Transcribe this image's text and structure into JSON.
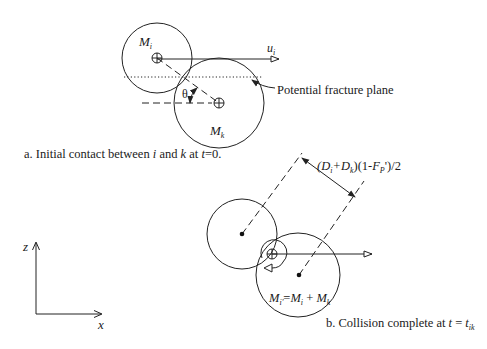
{
  "panel_a": {
    "caption_prefix": "a. Initial contact between ",
    "caption_i": "i",
    "caption_and": " and ",
    "caption_k": "k",
    "caption_at": " at ",
    "caption_t": "t",
    "caption_eq": "=0.",
    "mass_i": {
      "M": "M",
      "sub": "i"
    },
    "mass_k": {
      "M": "M",
      "sub": "k"
    },
    "velocity": {
      "u": "u",
      "sub": "i"
    },
    "angle_label": "θ",
    "fracture_label": "Potential fracture plane"
  },
  "panel_b": {
    "caption_prefix": "b. Collision complete at ",
    "caption_t": "t",
    "caption_eq": " = ",
    "caption_t2": "t",
    "caption_sub": "ik",
    "distance_label": {
      "open": "(",
      "D1": "D",
      "D1_sub": "i",
      "plus": "+",
      "D2": "D",
      "D2_sub": "k",
      "mid": ")(1-",
      "F": "F",
      "F_sub": "P",
      "end": "')/2"
    },
    "merged_mass": {
      "M1": "M",
      "M1_sub": "i'",
      "eq": "=",
      "M2": "M",
      "M2_sub": "i",
      "plus": " + ",
      "M3": "M",
      "M3_sub": "k"
    }
  },
  "axes": {
    "vertical": "z",
    "horizontal": "x"
  }
}
